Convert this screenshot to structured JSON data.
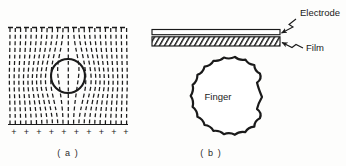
{
  "figure": {
    "background_color": "#fdfdfc",
    "ink_color": "#1a1a1a",
    "panels": [
      {
        "id": "a",
        "caption": "( a )",
        "description": "dashed electric field lines distorted around a circular object between a dashed upper boundary and a row of plus charges"
      },
      {
        "id": "b",
        "caption": "( b )",
        "description": "cross section of an electrode layer over a hatched film with a finger approaching from below"
      }
    ],
    "panel_a": {
      "caption": "( a )",
      "top_boundary_style": "dashed",
      "bottom_boundary_style": "solid",
      "field_line_style": "dashed",
      "field_line_count": 22,
      "circle": {
        "name": "object-circle",
        "cx": 68,
        "cy": 76,
        "r": 17
      },
      "charge_symbol": "+",
      "charge_count": 10,
      "charges": [
        "+",
        "+",
        "+",
        "+",
        "+",
        "+",
        "+",
        "+",
        "+",
        "+"
      ],
      "bounds": {
        "x": 8,
        "y": 27,
        "width": 120,
        "height": 98
      }
    },
    "panel_b": {
      "caption": "( b )",
      "electrode_label": "Electrode",
      "film_label": "Film",
      "finger_label": "Finger",
      "electrode": {
        "name": "electrode-layer",
        "x": 152,
        "y": 30,
        "width": 128,
        "height": 5,
        "fill": "#ffffff"
      },
      "film": {
        "name": "film-layer",
        "x": 152,
        "y": 37,
        "width": 128,
        "height": 9,
        "fill": "hatched"
      },
      "finger": {
        "name": "finger-outline",
        "cx": 218,
        "cy": 97,
        "r": 44,
        "scallop_count": 22,
        "scallop_amplitude": 4
      }
    }
  }
}
